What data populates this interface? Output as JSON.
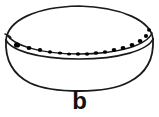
{
  "figure": {
    "label": "b",
    "caption_position": "bottom-center",
    "view": "oblique three-quarter",
    "drawing_style": "ink line drawing",
    "background_color": "#ffffff",
    "line_color": "#1a1a1a",
    "decoration_color": "#000000",
    "label_color": "#111111"
  },
  "vessel": {
    "name": "bowl",
    "rim": {
      "name": "rim-ellipse",
      "center_x": 79,
      "center_y": 36,
      "radius_x": 74,
      "radius_y": 22,
      "stroke_width": 1.6
    },
    "inner_rim": {
      "name": "inner-rim-line",
      "description": "second line parallel below rim front edge"
    },
    "body": {
      "name": "bowl-body",
      "profile": "rounded hemispherical base",
      "base_y": 88,
      "left_x": 5,
      "right_x": 153,
      "stroke_width": 1.7
    },
    "decoration": {
      "name": "impressed-dot-row",
      "type": "row of impressed dots",
      "count": 16,
      "dots": [
        {
          "cx": 17,
          "cy": 45,
          "rx": 3.1,
          "ry": 2.6
        },
        {
          "cx": 29,
          "cy": 48,
          "rx": 2.4,
          "ry": 2.0
        },
        {
          "cx": 40,
          "cy": 50,
          "rx": 2.2,
          "ry": 1.9
        },
        {
          "cx": 50,
          "cy": 52,
          "rx": 2.0,
          "ry": 1.7
        },
        {
          "cx": 60,
          "cy": 53,
          "rx": 2.2,
          "ry": 1.6
        },
        {
          "cx": 69,
          "cy": 54,
          "rx": 2.0,
          "ry": 1.6
        },
        {
          "cx": 78,
          "cy": 54,
          "rx": 2.2,
          "ry": 1.7
        },
        {
          "cx": 87,
          "cy": 54,
          "rx": 2.1,
          "ry": 1.7
        },
        {
          "cx": 96,
          "cy": 53,
          "rx": 2.4,
          "ry": 1.8
        },
        {
          "cx": 105,
          "cy": 52,
          "rx": 2.2,
          "ry": 1.8
        },
        {
          "cx": 114,
          "cy": 50,
          "rx": 2.3,
          "ry": 1.9
        },
        {
          "cx": 123,
          "cy": 48,
          "rx": 2.4,
          "ry": 2.0
        },
        {
          "cx": 132,
          "cy": 45,
          "rx": 2.4,
          "ry": 2.0
        },
        {
          "cx": 140,
          "cy": 41,
          "rx": 2.3,
          "ry": 2.0
        },
        {
          "cx": 146,
          "cy": 36,
          "rx": 2.1,
          "ry": 1.9
        },
        {
          "cx": 149,
          "cy": 30,
          "rx": 2.0,
          "ry": 1.8
        }
      ]
    }
  }
}
